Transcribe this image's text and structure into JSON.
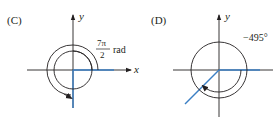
{
  "panels": [
    {
      "label": "(C)",
      "axis_x_label": "x",
      "axis_y_label": "y",
      "angle_numerator": "7π",
      "angle_denominator": "2",
      "angle_unit": "rad",
      "angle_value": "7π/2 rad",
      "rotation": "counterclockwise"
    },
    {
      "label": "(D)",
      "axis_y_label": "y",
      "angle_value": "−495°",
      "rotation": "clockwise"
    }
  ],
  "colors": {
    "axis": "#231f20",
    "terminal_side": "#3b7fc4"
  }
}
